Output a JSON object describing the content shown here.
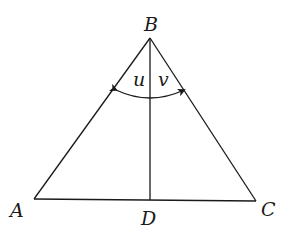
{
  "figure": {
    "type": "triangle-with-altitude",
    "vertices": {
      "A": {
        "label": "A",
        "x": 34,
        "y": 199
      },
      "B": {
        "label": "B",
        "x": 150,
        "y": 38
      },
      "C": {
        "label": "C",
        "x": 256,
        "y": 201
      },
      "D": {
        "label": "D",
        "x": 150,
        "y": 200
      }
    },
    "segments": [
      "AB",
      "BC",
      "AC",
      "BD"
    ],
    "angles": [
      {
        "label": "u",
        "between": [
          "BA",
          "BD"
        ]
      },
      {
        "label": "v",
        "between": [
          "BD",
          "BC"
        ]
      }
    ],
    "arc": {
      "description": "double-headed arrow arc spanning angles u and v at vertex B"
    }
  },
  "labels": {
    "A": "A",
    "B": "B",
    "C": "C",
    "D": "D",
    "u": "u",
    "v": "v"
  },
  "colors": {
    "stroke": "#1a1a1a",
    "background": "#ffffff"
  }
}
